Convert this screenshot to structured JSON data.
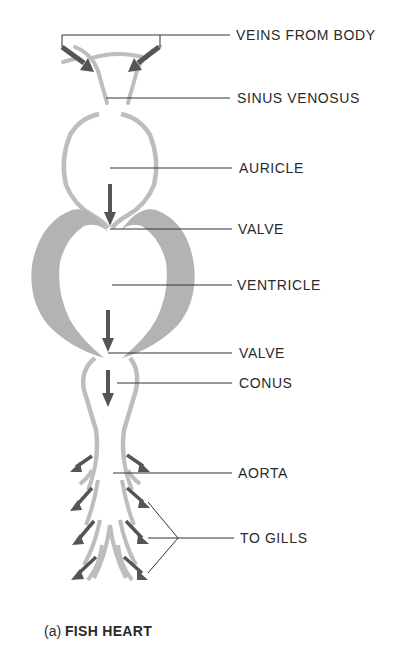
{
  "figure": {
    "title": "FISH HEART",
    "caption_prefix": "(a)",
    "caption_title": "FISH HEART"
  },
  "labels": [
    {
      "id": "veins",
      "text": "VEINS FROM BODY"
    },
    {
      "id": "sinus",
      "text": "SINUS VENOSUS"
    },
    {
      "id": "auricle",
      "text": "AURICLE"
    },
    {
      "id": "valve1",
      "text": "VALVE"
    },
    {
      "id": "ventricle",
      "text": "VENTRICLE"
    },
    {
      "id": "valve2",
      "text": "VALVE"
    },
    {
      "id": "conus",
      "text": "CONUS"
    },
    {
      "id": "aorta",
      "text": "AORTA"
    },
    {
      "id": "gills",
      "text": "TO GILLS"
    }
  ],
  "colors": {
    "wall": "#bdbdbd",
    "ventricle_wall": "#b3b3b3",
    "arrow": "#555555",
    "leader": "#333333",
    "text": "#2a2a2a"
  }
}
